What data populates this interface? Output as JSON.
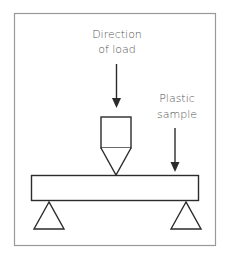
{
  "diagram": {
    "labels": {
      "load_line1": "Direction",
      "load_line2": "of load",
      "sample_line1": "Plastic",
      "sample_line2": "sample"
    },
    "colors": {
      "stroke": "#2b2b2b",
      "frame": "#999999",
      "text": "#555555"
    }
  }
}
